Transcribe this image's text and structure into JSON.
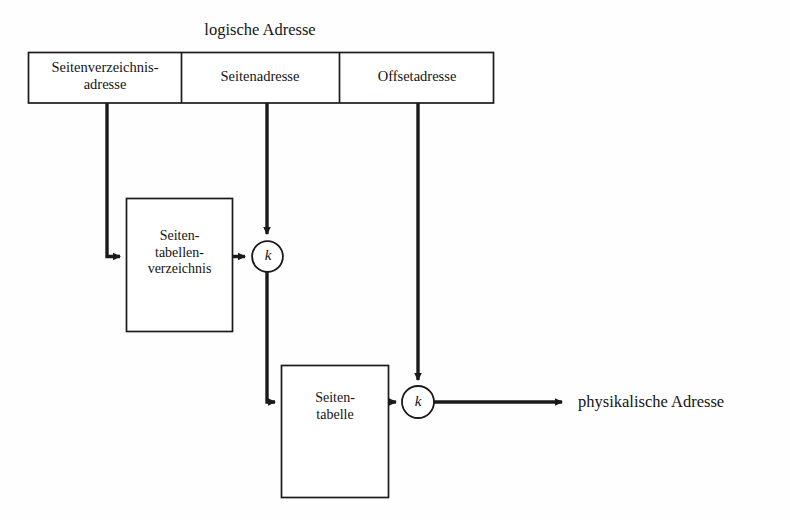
{
  "diagram": {
    "title": "logische Adresse",
    "address_fields": [
      {
        "label": "Seitenverzeichnis-\nadresse"
      },
      {
        "label": "Seitenadresse"
      },
      {
        "label": "Offsetadresse"
      }
    ],
    "blocks": [
      {
        "name": "page-directory-block",
        "label": "Seiten-\ntabellen-\nverzeichnis"
      },
      {
        "name": "page-table-block",
        "label": "Seiten-\ntabelle"
      }
    ],
    "junctions": [
      {
        "name": "junction-1",
        "label": "k"
      },
      {
        "name": "junction-2",
        "label": "k"
      }
    ],
    "output": {
      "label": "physikalische Adresse"
    },
    "colors": {
      "line": "#1a1a1a",
      "text": "#141414",
      "background": "#fefefe"
    }
  }
}
